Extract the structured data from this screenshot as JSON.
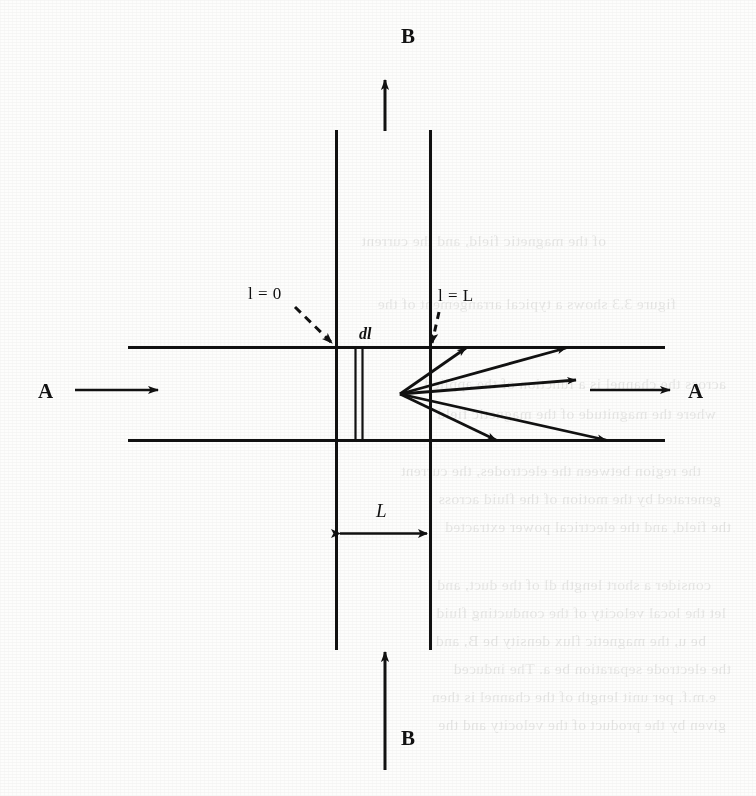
{
  "figure": {
    "type": "physics-schematic",
    "ink_color": "#111111",
    "paper_color": "#fdfdfc"
  },
  "labels": {
    "field_top": "B",
    "field_bottom": "B",
    "flow_left": "A",
    "flow_right": "A",
    "l_zero": "l = 0",
    "l_length": "l = L",
    "element": "dl",
    "length": "L"
  },
  "geometry": {
    "channel": {
      "top_y": 347,
      "bottom_y": 440,
      "x_start": 128,
      "x_end": 665
    },
    "field_lines": {
      "left_x": 336,
      "right_x": 430,
      "y_top": 130,
      "y_bottom": 650
    },
    "element_slab": {
      "x_left": 355,
      "x_right": 362
    },
    "fan_origin": {
      "x": 400,
      "y": 394
    },
    "dimension_L": {
      "y": 533,
      "x_left": 336,
      "x_right": 430
    }
  },
  "arrows": {
    "field_top": {
      "x": 385,
      "y_tail": 130,
      "y_head": 78
    },
    "field_bottom": {
      "x": 385,
      "y_tail": 770,
      "y_head": 650
    },
    "flow_left": {
      "x_tail": 75,
      "x_head": 160,
      "y": 390
    },
    "flow_right": {
      "x_tail": 590,
      "x_head": 672,
      "y": 390
    },
    "fan": [
      {
        "id": "ray-upper-near",
        "x_end": 470,
        "y_end": 347
      },
      {
        "id": "ray-upper-far",
        "x_end": 570,
        "y_end": 347
      },
      {
        "id": "ray-middle",
        "x_end": 580,
        "y_end": 380
      },
      {
        "id": "ray-lower-near",
        "x_end": 500,
        "y_end": 440
      },
      {
        "id": "ray-lower-far",
        "x_end": 610,
        "y_end": 440
      }
    ]
  },
  "leaders": {
    "l_zero": {
      "x_tail": 295,
      "y_tail": 307,
      "x_head": 334,
      "y_head": 344
    },
    "l_length": {
      "x_tail": 438,
      "y_tail": 310,
      "x_head": 431,
      "y_head": 344
    }
  },
  "bleed_through": {
    "note": "faint mirrored text from reverse side of scanned page",
    "lines": [
      {
        "x": 150,
        "y": 232,
        "text": "of the magnetic field, and the current"
      },
      {
        "x": 80,
        "y": 295,
        "text": "figure 3.3 shows a typical arrangement of the"
      },
      {
        "x": 30,
        "y": 375,
        "text": "across the channel is a function of the applied"
      },
      {
        "x": 40,
        "y": 405,
        "text": "where the magnitude of the magnetic field"
      },
      {
        "x": 55,
        "y": 462,
        "text": "the region between the electrodes, the current"
      },
      {
        "x": 35,
        "y": 490,
        "text": "generated by the motion of the fluid across"
      },
      {
        "x": 25,
        "y": 518,
        "text": "the field, and the electrical power extracted"
      },
      {
        "x": 45,
        "y": 576,
        "text": "consider a short length dl of the duct, and"
      },
      {
        "x": 30,
        "y": 604,
        "text": "let the local velocity of the conducting fluid"
      },
      {
        "x": 50,
        "y": 632,
        "text": "be u, the magnetic flux density be B, and"
      },
      {
        "x": 25,
        "y": 660,
        "text": "the electrode separation be a. The induced"
      },
      {
        "x": 40,
        "y": 688,
        "text": "e.m.f. per unit length of the channel is then"
      },
      {
        "x": 30,
        "y": 716,
        "text": "given by the product of the velocity and the"
      }
    ]
  }
}
